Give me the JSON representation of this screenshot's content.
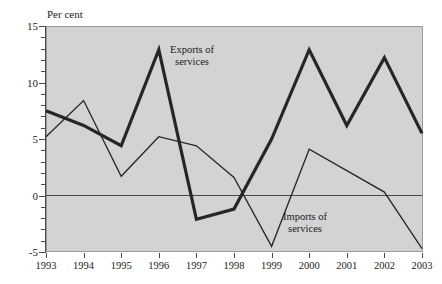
{
  "chart_data": {
    "type": "line",
    "title": "",
    "ylabel": "Per cent",
    "xlabel": "",
    "grid": false,
    "legend_position": "inline-annotations",
    "ylim": [
      -5,
      15
    ],
    "yticks": [
      -5,
      0,
      5,
      10,
      15
    ],
    "ytick_labels": [
      "-5",
      "0",
      "5",
      "10",
      "15"
    ],
    "minor_yticks": [
      -4,
      -3,
      -2,
      -1,
      1,
      2,
      3,
      4,
      6,
      7,
      8,
      9,
      11,
      12,
      13,
      14
    ],
    "categories": [
      "1993",
      "1994",
      "1995",
      "1996",
      "1997",
      "1998",
      "1999",
      "2000",
      "2001",
      "2002",
      "2003"
    ],
    "x": [
      1993,
      1994,
      1995,
      1996,
      1997,
      1998,
      1999,
      2000,
      2001,
      2002,
      2003
    ],
    "zero_line": 0,
    "series": [
      {
        "name": "Exports of services",
        "style": "thick",
        "color": "#262626",
        "line_width": 3.2,
        "values": [
          7.5,
          6.2,
          4.4,
          12.9,
          -2.1,
          -1.2,
          5.0,
          12.9,
          6.2,
          12.2,
          5.5
        ]
      },
      {
        "name": "Imports of services",
        "style": "thin",
        "color": "#262626",
        "line_width": 1.3,
        "values": [
          5.2,
          8.4,
          1.7,
          5.2,
          4.4,
          1.6,
          -4.5,
          4.1,
          2.2,
          0.3,
          -4.7
        ]
      }
    ],
    "annotations": [
      {
        "id": "exports",
        "text_line1": "Exports of",
        "text_line2": "services"
      },
      {
        "id": "imports",
        "text_line1": "Imports of",
        "text_line2": "services"
      }
    ]
  },
  "colors": {
    "plot_background": "#d3d3d3",
    "page_background": "#ffffff",
    "axis": "#4a4a4a",
    "line": "#262626",
    "text": "#1a1a1a"
  }
}
